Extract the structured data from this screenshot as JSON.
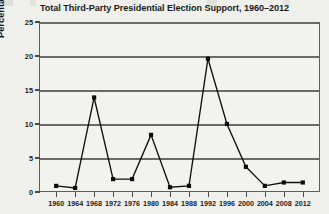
{
  "chart_data": {
    "type": "line",
    "title": "Total Third-Party Presidential Election Support, 1960–2012",
    "xlabel": "",
    "ylabel": "Percentage of popular vote",
    "categories": [
      "1960",
      "1964",
      "1968",
      "1972",
      "1976",
      "1980",
      "1984",
      "1988",
      "1992",
      "1996",
      "2000",
      "2004",
      "2008",
      "2012"
    ],
    "x": [
      1960,
      1964,
      1968,
      1972,
      1976,
      1980,
      1984,
      1988,
      1992,
      1996,
      2000,
      2004,
      2008,
      2012
    ],
    "values": [
      0.9,
      0.6,
      13.9,
      1.9,
      1.9,
      8.4,
      0.7,
      0.9,
      19.6,
      10.0,
      3.7,
      0.9,
      1.4,
      1.4
    ],
    "series": [
      {
        "name": "Total third-party share of popular vote",
        "values": [
          0.9,
          0.6,
          13.9,
          1.9,
          1.9,
          8.4,
          0.7,
          0.9,
          19.6,
          10.0,
          3.7,
          0.9,
          1.4,
          1.4
        ]
      }
    ],
    "ylim": [
      0,
      25
    ],
    "yticks": [
      0,
      5,
      10,
      15,
      20,
      25
    ],
    "ytick_labels": [
      "0",
      "5",
      "10",
      "15",
      "20",
      "25"
    ],
    "xlim": [
      1958,
      2014
    ],
    "grid": "horizontal",
    "legend": "none",
    "marker": "square",
    "line_color": "#111111",
    "marker_color": "#0d0d0d",
    "grid_color": "#6a6a6a",
    "background_color": "#f2f2ef",
    "page_color": "#efefec"
  }
}
